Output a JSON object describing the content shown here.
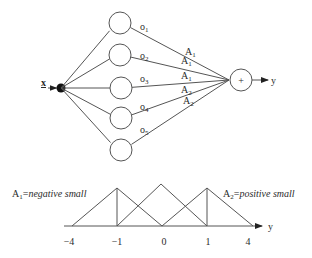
{
  "network": {
    "input": {
      "label": "x",
      "dot": {
        "cx": 61,
        "cy": 88,
        "r": 4.5
      },
      "label_pos": {
        "x": 41,
        "y": 88
      }
    },
    "hidden_nodes": [
      {
        "cx": 120,
        "cy": 23,
        "r": 11,
        "out_label": "o",
        "out_sub": "1",
        "label_pos": {
          "x": 140,
          "y": 30
        },
        "weight": "A",
        "weight_sub": "1",
        "weight_pos": {
          "x": 185,
          "y": 55
        }
      },
      {
        "cx": 120,
        "cy": 55,
        "r": 11,
        "out_label": "o",
        "out_sub": "2",
        "label_pos": {
          "x": 140,
          "y": 59
        },
        "weight": "A",
        "weight_sub": "1",
        "weight_pos": {
          "x": 181,
          "y": 64
        }
      },
      {
        "cx": 121,
        "cy": 88,
        "r": 11,
        "out_label": "o",
        "out_sub": "3",
        "label_pos": {
          "x": 140,
          "y": 82
        },
        "weight": "A",
        "weight_sub": "1",
        "weight_pos": {
          "x": 181,
          "y": 79
        }
      },
      {
        "cx": 121,
        "cy": 118,
        "r": 11,
        "out_label": "o",
        "out_sub": "4",
        "label_pos": {
          "x": 140,
          "y": 110
        },
        "weight": "A",
        "weight_sub": "2",
        "weight_pos": {
          "x": 181,
          "y": 93
        }
      },
      {
        "cx": 121,
        "cy": 150,
        "r": 11,
        "out_label": "o",
        "out_sub": "5",
        "label_pos": {
          "x": 140,
          "y": 133
        },
        "weight": "A",
        "weight_sub": "2",
        "weight_pos": {
          "x": 183,
          "y": 104
        }
      }
    ],
    "sum_node": {
      "cx": 241,
      "cy": 80,
      "r": 11,
      "symbol": "+",
      "input_point": {
        "x": 229,
        "y": 80
      }
    },
    "output": {
      "label": "y",
      "arrow_end": 268,
      "label_pos": {
        "x": 271,
        "y": 84
      }
    }
  },
  "membership": {
    "baseline": {
      "y": 226,
      "x1": 64,
      "x2": 262
    },
    "axis_label": "y",
    "axis_label_pos": {
      "x": 268,
      "y": 230
    },
    "triangles": [
      {
        "x1": 72,
        "peak_x": 117,
        "peak_y": 188,
        "x2": 162
      },
      {
        "x1": 117,
        "peak_x": 161,
        "peak_y": 184,
        "x2": 207
      },
      {
        "x1": 162,
        "peak_x": 207,
        "peak_y": 188,
        "x2": 253
      }
    ],
    "verticals": [
      {
        "x": 117,
        "y1": 188,
        "y2": 226
      },
      {
        "x": 207,
        "y1": 188,
        "y2": 226
      }
    ],
    "ticks": [
      {
        "label": "−4",
        "x": 69
      },
      {
        "label": "−1",
        "x": 117
      },
      {
        "label": "0",
        "x": 164
      },
      {
        "label": "1",
        "x": 208
      },
      {
        "label": "4",
        "x": 248
      }
    ],
    "tick_label_y": 245,
    "legend": [
      {
        "name": "A",
        "sub": "1",
        "eq": "=",
        "desc": "negative small",
        "x": 12,
        "y": 197
      },
      {
        "name": "A",
        "sub": "2",
        "eq": "=",
        "desc": "positive small",
        "x": 223,
        "y": 197
      }
    ]
  }
}
